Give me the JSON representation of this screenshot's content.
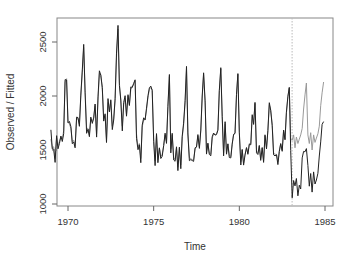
{
  "chart_data": {
    "type": "line",
    "title": "",
    "xlabel": "Time",
    "ylabel": "Observed / Fitted",
    "xlim": [
      1969,
      1985.1
    ],
    "ylim": [
      1000,
      2700
    ],
    "x_ticks": [
      1970,
      1975,
      1980,
      1985
    ],
    "y_ticks": [
      1000,
      1500,
      2000,
      2500
    ],
    "grid": false,
    "legend": null,
    "annotations": [
      {
        "type": "vline",
        "x": 1983.08,
        "style": "dotted",
        "color": "#aaaaaa",
        "label": ""
      }
    ],
    "x_start": 1969.0,
    "x_step": 0.0833333,
    "series": [
      {
        "name": "Observed",
        "color": "#222222",
        "values": [
          1687,
          1508,
          1507,
          1385,
          1632,
          1511,
          1559,
          1630,
          1579,
          1653,
          2152,
          2148,
          1752,
          1765,
          1717,
          1558,
          1575,
          1520,
          1805,
          1800,
          1719,
          2008,
          2242,
          2478,
          2030,
          1655,
          1693,
          1623,
          1805,
          1746,
          1795,
          1926,
          1619,
          1992,
          2233,
          2192,
          2080,
          1768,
          1835,
          1569,
          1976,
          1853,
          1965,
          1689,
          1778,
          1976,
          2397,
          2654,
          2097,
          1963,
          1677,
          1941,
          2003,
          1813,
          2012,
          1912,
          2084,
          2080,
          2118,
          2150,
          1608,
          1503,
          1548,
          1382,
          1731,
          1798,
          1779,
          1887,
          2004,
          2077,
          2092,
          2051,
          1577,
          1356,
          1652,
          1382,
          1519,
          1421,
          1442,
          1543,
          1656,
          1561,
          1905,
          2199,
          1473,
          1655,
          1407,
          1395,
          1530,
          1309,
          1526,
          1327,
          1627,
          1748,
          1958,
          2274,
          1648,
          1401,
          1411,
          1403,
          1394,
          1520,
          1528,
          1643,
          1515,
          1685,
          2000,
          2215,
          1956,
          1462,
          1563,
          1459,
          1446,
          1622,
          1657,
          1638,
          1643,
          1683,
          2050,
          2262,
          1813,
          1445,
          1762,
          1461,
          1556,
          1431,
          1427,
          1554,
          1645,
          1653,
          2016,
          2207,
          1665,
          1361,
          1506,
          1360,
          1453,
          1522,
          1460,
          1552,
          1548,
          1827,
          1737,
          1941,
          1474,
          1458,
          1542,
          1404,
          1522,
          1385,
          1641,
          1510,
          1681,
          1938,
          1868,
          1726,
          1456,
          1445,
          1456,
          1365,
          1487,
          1558,
          1488,
          1684,
          1594,
          1850,
          1998,
          2079,
          1494,
          1057,
          1218,
          1168,
          1236,
          1076,
          1174,
          1139,
          1427,
          1487,
          1483,
          1513,
          1357,
          1165,
          1282,
          1110,
          1297,
          1185,
          1222,
          1284,
          1444,
          1575,
          1737,
          1763
        ]
      },
      {
        "name": "Fitted",
        "color": "#999999",
        "values": [
          1600,
          1520,
          1530,
          1420,
          1610,
          1540,
          1580,
          1620,
          1600,
          1680,
          2130,
          2160,
          1760,
          1740,
          1700,
          1580,
          1590,
          1540,
          1790,
          1790,
          1740,
          1990,
          2220,
          2450,
          2050,
          1700,
          1700,
          1640,
          1790,
          1760,
          1800,
          1910,
          1650,
          1960,
          2210,
          2200,
          2060,
          1790,
          1820,
          1600,
          1940,
          1860,
          1950,
          1720,
          1790,
          1960,
          2360,
          2620,
          2120,
          1960,
          1720,
          1920,
          1980,
          1830,
          2000,
          1920,
          2060,
          2080,
          2110,
          2140,
          1650,
          1530,
          1560,
          1420,
          1710,
          1780,
          1780,
          1870,
          1990,
          2060,
          2080,
          2060,
          1600,
          1400,
          1640,
          1410,
          1520,
          1440,
          1460,
          1540,
          1640,
          1580,
          1890,
          2180,
          1510,
          1640,
          1430,
          1410,
          1520,
          1340,
          1520,
          1360,
          1610,
          1730,
          1940,
          2250,
          1660,
          1430,
          1420,
          1410,
          1410,
          1510,
          1530,
          1630,
          1530,
          1680,
          1980,
          2200,
          1940,
          1490,
          1560,
          1470,
          1460,
          1610,
          1650,
          1640,
          1650,
          1690,
          2040,
          2250,
          1810,
          1470,
          1740,
          1480,
          1560,
          1450,
          1440,
          1560,
          1640,
          1660,
          2010,
          2200,
          1670,
          1390,
          1500,
          1380,
          1460,
          1520,
          1470,
          1560,
          1560,
          1810,
          1740,
          1930,
          1490,
          1470,
          1540,
          1420,
          1520,
          1400,
          1630,
          1520,
          1680,
          1920,
          1870,
          1740,
          1470,
          1460,
          1460,
          1390,
          1490,
          1560,
          1500,
          1680,
          1600,
          1840,
          1990,
          2080,
          1600,
          1590,
          1640,
          1520,
          1620,
          1560,
          1600,
          1640,
          1700,
          1880,
          2010,
          2120,
          1640,
          1560,
          1660,
          1500,
          1640,
          1570,
          1610,
          1650,
          1720,
          1910,
          2030,
          2130
        ]
      }
    ]
  }
}
